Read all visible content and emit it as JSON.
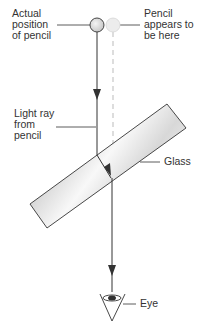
{
  "diagram": {
    "labels": {
      "actual_position": "Actual\nposition\nof pencil",
      "apparent_position": "Pencil\nappears to\nbe here",
      "light_ray": "Light ray\nfrom\npencil",
      "glass": "Glass",
      "eye": "Eye"
    },
    "colors": {
      "line": "#333333",
      "dashed": "#bbbbbb",
      "pencil_actual": "#d8d8d8",
      "pencil_apparent": "#e8e8e8",
      "glass_fill": "#e6e6e6"
    }
  }
}
